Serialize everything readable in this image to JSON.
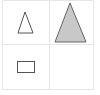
{
  "puzzle": {
    "type": "2x2 shape analogy matrix",
    "grid": {
      "x": 2,
      "y": 0,
      "width": 91,
      "height": 89,
      "divider_x": 49,
      "divider_y": 44,
      "line_color": "#e6e6e6"
    },
    "cells": [
      {
        "position": "top-left",
        "shape": "triangle",
        "size": "small",
        "fill": "none",
        "stroke": "#555555",
        "points": "25,12 18,33 33,33"
      },
      {
        "position": "top-right",
        "shape": "triangle",
        "size": "large",
        "fill": "#c8c8c8",
        "stroke": "#666666",
        "points": "70,3 55,42 86,42"
      },
      {
        "position": "bottom-left",
        "shape": "rectangle",
        "size": "small",
        "fill": "none",
        "stroke": "#555555",
        "x": 17,
        "y": 61,
        "width": 17,
        "height": 11
      },
      {
        "position": "bottom-right",
        "shape": "empty",
        "size": "",
        "fill": "none",
        "stroke": ""
      }
    ]
  }
}
